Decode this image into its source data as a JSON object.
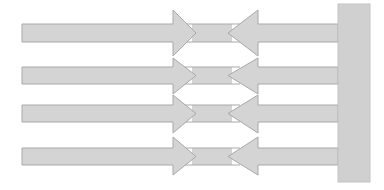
{
  "diagram": {
    "colors": {
      "fill": "#d4d4d4",
      "stroke": "#a8a8a8",
      "wall_fill": "#d0d0d0",
      "background": "#ffffff"
    },
    "wall": {
      "x": 338,
      "y": 4,
      "width": 32,
      "height": 178
    },
    "rows": [
      {
        "shaft_top": 24,
        "shaft_bottom": 42,
        "head_top": 10,
        "head_bottom": 56
      },
      {
        "shaft_top": 67,
        "shaft_bottom": 84,
        "head_top": 58,
        "head_bottom": 94
      },
      {
        "shaft_top": 105,
        "shaft_bottom": 122,
        "head_top": 95,
        "head_bottom": 133
      },
      {
        "shaft_top": 148,
        "shaft_bottom": 165,
        "head_top": 137,
        "head_bottom": 175
      }
    ],
    "left_arrow": {
      "x_start": 22,
      "head_base_x": 173,
      "tip_x": 196
    },
    "right_arrow": {
      "tip_x": 228,
      "head_base_x": 258,
      "x_end": 338
    }
  }
}
